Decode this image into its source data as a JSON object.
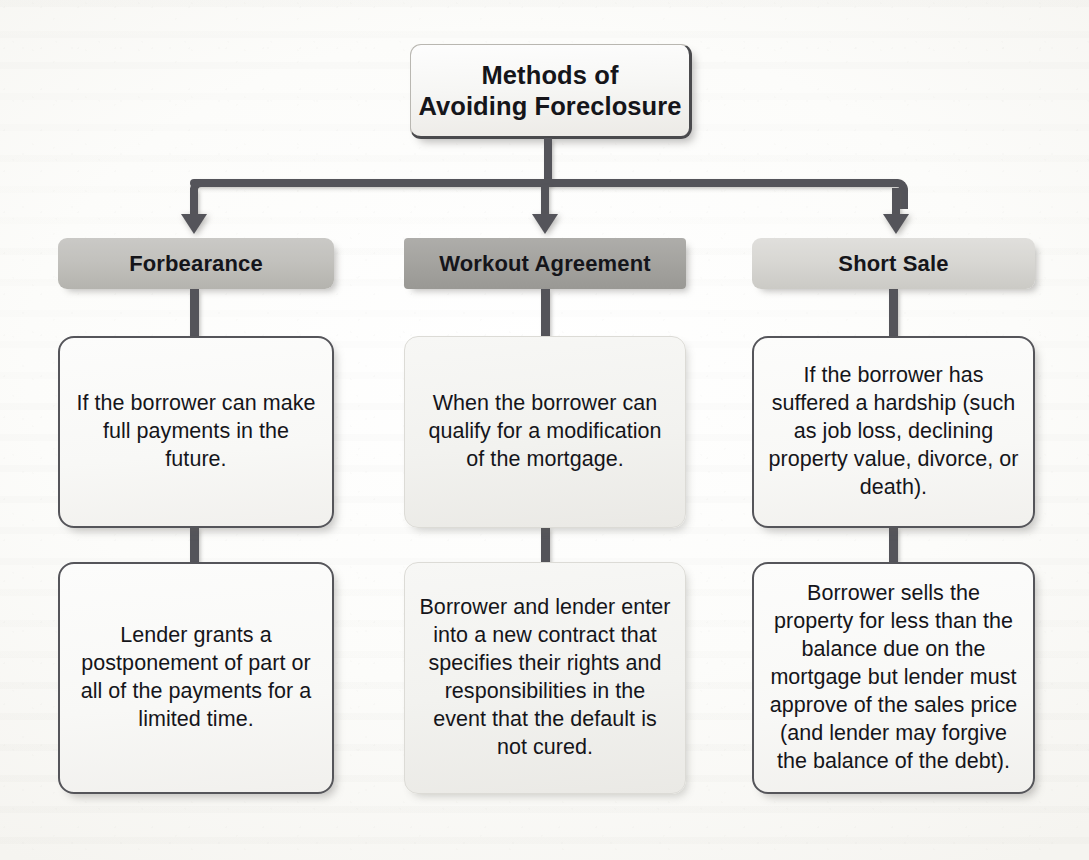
{
  "diagram": {
    "title": "Methods of\nAvoiding Foreclosure",
    "title_line_1": "Methods of",
    "title_line_2": "Avoiding Foreclosure",
    "colors": {
      "connector": "#54545a",
      "node_border": "#55555a",
      "header_1_fill": "#c2c1bd",
      "header_2_fill": "#a5a4a0",
      "header_3_fill": "#d8d7d3",
      "page_background": "#fbfbf9",
      "text": "#15151a"
    },
    "columns": [
      {
        "header": "Forbearance",
        "boxes": [
          "If the borrower can make full payments in the future.",
          "Lender grants a postponement of part or all of the payments for a limited time."
        ]
      },
      {
        "header": "Workout Agreement",
        "boxes": [
          "When the borrower can qualify for a modification of the mortgage.",
          "Borrower and lender enter into a new contract that specifies their rights and responsibilities in the event that the default is not cured."
        ]
      },
      {
        "header": "Short Sale",
        "boxes": [
          "If the borrower has suffered a hardship (such as job loss, declining property value, divorce, or death).",
          "Borrower sells the property for less than the balance due on the mortgage but lender must approve of the sales price (and lender may forgive the balance of the debt)."
        ]
      }
    ]
  }
}
